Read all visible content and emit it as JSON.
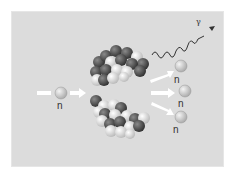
{
  "diagram": {
    "title": "",
    "incoming_neutron": {
      "label": "n"
    },
    "emitted_neutrons": [
      {
        "label": "n"
      },
      {
        "label": "n"
      },
      {
        "label": "n"
      }
    ],
    "gamma_ray": {
      "label": "γ"
    },
    "fragments": [
      "upper-fission-fragment",
      "lower-fission-fragment"
    ],
    "colors": {
      "background": "#dcdcdc",
      "arrow": "#ffffff",
      "neutron": "#c8c8c8",
      "dark_nucleon": "#4a4a4a",
      "light_nucleon": "#e8e8e8"
    }
  }
}
